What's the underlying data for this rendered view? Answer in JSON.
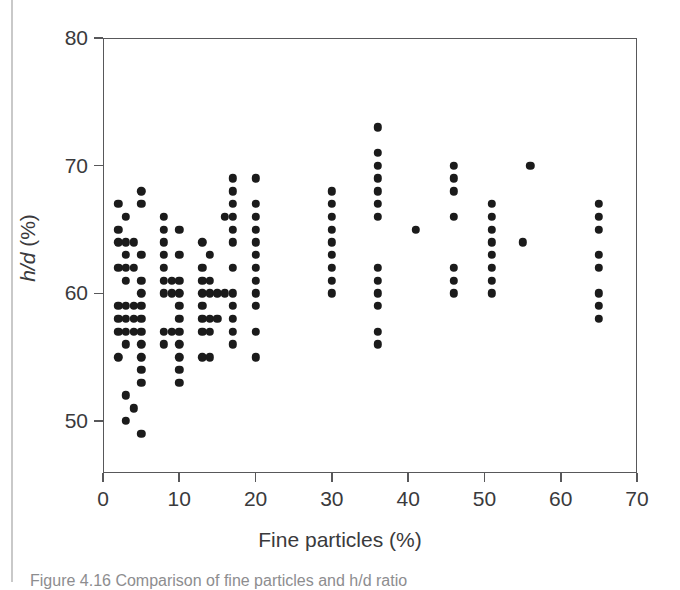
{
  "figure": {
    "caption": "Figure 4.16   Comparison of fine particles and h/d ratio"
  },
  "chart_data": {
    "type": "scatter",
    "title": "",
    "xlabel": "Fine particles (%)",
    "ylabel": "h/d (%)",
    "ylabel_italic_part": "h/d",
    "ylabel_rest": " (%)",
    "xlim": [
      0,
      70
    ],
    "ylim": [
      47,
      80
    ],
    "xticks": [
      0,
      10,
      20,
      30,
      40,
      50,
      60,
      70
    ],
    "xticklabels": [
      "0",
      "10",
      "20",
      "30",
      "40",
      "50",
      "60",
      "70"
    ],
    "yticks": [
      50,
      60,
      70,
      80
    ],
    "yticklabels": [
      "50",
      "60",
      "70",
      "80"
    ],
    "grid": false,
    "legend": null,
    "marker": "filled-circle",
    "marker_color": "#1b1b1b",
    "axis_color": "#58585a",
    "background": "#ffffff",
    "points": [
      [
        2,
        67
      ],
      [
        2,
        65
      ],
      [
        2,
        64
      ],
      [
        2,
        62
      ],
      [
        2,
        59
      ],
      [
        2,
        58
      ],
      [
        2,
        57
      ],
      [
        2,
        55
      ],
      [
        3,
        66
      ],
      [
        3,
        64
      ],
      [
        3,
        63
      ],
      [
        3,
        62
      ],
      [
        3,
        61
      ],
      [
        3,
        59
      ],
      [
        3,
        58
      ],
      [
        3,
        57
      ],
      [
        3,
        56
      ],
      [
        3,
        52
      ],
      [
        3,
        50
      ],
      [
        4,
        64
      ],
      [
        4,
        62
      ],
      [
        4,
        59
      ],
      [
        4,
        58
      ],
      [
        4,
        57
      ],
      [
        4,
        51
      ],
      [
        5,
        68
      ],
      [
        5,
        67
      ],
      [
        5,
        63
      ],
      [
        5,
        61
      ],
      [
        5,
        60
      ],
      [
        5,
        59
      ],
      [
        5,
        58
      ],
      [
        5,
        57
      ],
      [
        5,
        56
      ],
      [
        5,
        55
      ],
      [
        5,
        54
      ],
      [
        5,
        53
      ],
      [
        5,
        49
      ],
      [
        8,
        66
      ],
      [
        8,
        65
      ],
      [
        8,
        64
      ],
      [
        8,
        63
      ],
      [
        8,
        62
      ],
      [
        8,
        61
      ],
      [
        8,
        60
      ],
      [
        8,
        57
      ],
      [
        8,
        56
      ],
      [
        9,
        61
      ],
      [
        9,
        60
      ],
      [
        9,
        57
      ],
      [
        10,
        65
      ],
      [
        10,
        63
      ],
      [
        10,
        61
      ],
      [
        10,
        60
      ],
      [
        10,
        59
      ],
      [
        10,
        58
      ],
      [
        10,
        57
      ],
      [
        10,
        56
      ],
      [
        10,
        55
      ],
      [
        10,
        54
      ],
      [
        10,
        53
      ],
      [
        13,
        64
      ],
      [
        13,
        62
      ],
      [
        13,
        61
      ],
      [
        13,
        60
      ],
      [
        13,
        59
      ],
      [
        13,
        58
      ],
      [
        13,
        57
      ],
      [
        13,
        55
      ],
      [
        14,
        63
      ],
      [
        14,
        61
      ],
      [
        14,
        60
      ],
      [
        14,
        58
      ],
      [
        14,
        57
      ],
      [
        14,
        55
      ],
      [
        15,
        60
      ],
      [
        15,
        58
      ],
      [
        16,
        66
      ],
      [
        16,
        60
      ],
      [
        17,
        69
      ],
      [
        17,
        68
      ],
      [
        17,
        67
      ],
      [
        17,
        66
      ],
      [
        17,
        65
      ],
      [
        17,
        64
      ],
      [
        17,
        62
      ],
      [
        17,
        60
      ],
      [
        17,
        59
      ],
      [
        17,
        58
      ],
      [
        17,
        57
      ],
      [
        17,
        56
      ],
      [
        20,
        69
      ],
      [
        20,
        67
      ],
      [
        20,
        66
      ],
      [
        20,
        65
      ],
      [
        20,
        64
      ],
      [
        20,
        63
      ],
      [
        20,
        62
      ],
      [
        20,
        61
      ],
      [
        20,
        60
      ],
      [
        20,
        59
      ],
      [
        20,
        57
      ],
      [
        20,
        55
      ],
      [
        30,
        68
      ],
      [
        30,
        67
      ],
      [
        30,
        66
      ],
      [
        30,
        65
      ],
      [
        30,
        64
      ],
      [
        30,
        63
      ],
      [
        30,
        62
      ],
      [
        30,
        61
      ],
      [
        30,
        60
      ],
      [
        36,
        73
      ],
      [
        36,
        71
      ],
      [
        36,
        70
      ],
      [
        36,
        69
      ],
      [
        36,
        68
      ],
      [
        36,
        67
      ],
      [
        36,
        66
      ],
      [
        36,
        62
      ],
      [
        36,
        61
      ],
      [
        36,
        60
      ],
      [
        36,
        59
      ],
      [
        36,
        57
      ],
      [
        36,
        56
      ],
      [
        41,
        65
      ],
      [
        46,
        70
      ],
      [
        46,
        69
      ],
      [
        46,
        68
      ],
      [
        46,
        66
      ],
      [
        46,
        62
      ],
      [
        46,
        61
      ],
      [
        46,
        60
      ],
      [
        51,
        67
      ],
      [
        51,
        66
      ],
      [
        51,
        65
      ],
      [
        51,
        64
      ],
      [
        51,
        63
      ],
      [
        51,
        62
      ],
      [
        51,
        61
      ],
      [
        51,
        60
      ],
      [
        55,
        64
      ],
      [
        56,
        70
      ],
      [
        65,
        67
      ],
      [
        65,
        66
      ],
      [
        65,
        65
      ],
      [
        65,
        63
      ],
      [
        65,
        62
      ],
      [
        65,
        60
      ],
      [
        65,
        59
      ],
      [
        65,
        58
      ]
    ]
  }
}
